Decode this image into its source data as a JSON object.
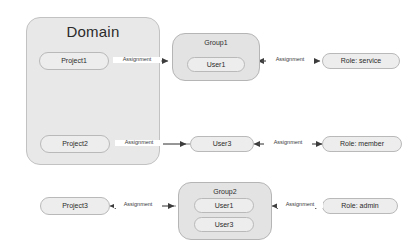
{
  "diagram": {
    "title": "Domain",
    "type": "entity-relationship-assignment-diagram",
    "colors": {
      "domain_fill": "#e8e8e8",
      "group_fill": "#e3e3e3",
      "node_fill": "#ededed",
      "border": "#b9b9b9",
      "edge": "#5a5a5a",
      "text": "#2b2b2b",
      "background": "#ffffff"
    },
    "domain": {
      "label": "Domain",
      "projects": [
        {
          "label": "Project1"
        },
        {
          "label": "Project2"
        }
      ]
    },
    "groups": [
      {
        "label": "Group1",
        "members": [
          {
            "label": "User1"
          }
        ]
      },
      {
        "label": "Group2",
        "members": [
          {
            "label": "User1"
          },
          {
            "label": "User3"
          }
        ]
      }
    ],
    "users": [
      {
        "label": "User3"
      }
    ],
    "projects_outside": [
      {
        "label": "Project3"
      }
    ],
    "roles": [
      {
        "label": "Role: service"
      },
      {
        "label": "Role: member"
      },
      {
        "label": "Role: admin"
      }
    ],
    "edges": [
      {
        "label": "Assignment",
        "from": "Project1",
        "to": "Group1"
      },
      {
        "label": "Assignment",
        "from": "Group1",
        "to": "Role: service"
      },
      {
        "label": "Assignment",
        "from": "Project2",
        "to": "User3"
      },
      {
        "label": "Assignment",
        "from": "User3",
        "to": "Role: member"
      },
      {
        "label": "Assignment",
        "from": "Project3",
        "to": "Group2"
      },
      {
        "label": "Assignment",
        "from": "Group2",
        "to": "Role: admin"
      }
    ]
  }
}
